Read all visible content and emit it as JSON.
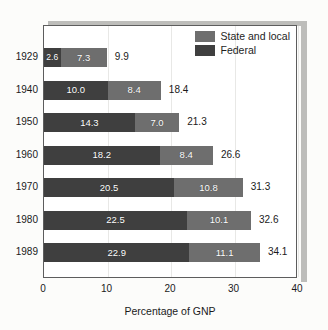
{
  "figure": {
    "background_color": "#fcfcfa",
    "plot_background_color": "#ffffff",
    "frame_color": "#5d5d5d",
    "shadow_color": "#bdbdba",
    "gridline_color": "#e8e8e6"
  },
  "legend": {
    "position": "top-right-inside",
    "entries": [
      {
        "label": "State and local",
        "color": "#6e6e6e",
        "swatch_name": "legend-swatch-state-and-local"
      },
      {
        "label": "Federal",
        "color": "#3f3f3f",
        "swatch_name": "legend-swatch-federal"
      }
    ]
  },
  "axis": {
    "x_title": "Percentage of GNP",
    "x_ticks": [
      "0",
      "10",
      "20",
      "30",
      "40"
    ],
    "x_min": 0,
    "x_max": 40
  },
  "chart_data": {
    "type": "bar",
    "orientation": "horizontal",
    "stacked": true,
    "title": "",
    "subtitle": "",
    "xlabel": "Percentage of GNP",
    "ylabel": "",
    "xlim": [
      0,
      40
    ],
    "xticks": [
      0,
      10,
      20,
      30,
      40
    ],
    "grid": true,
    "legend_position": "top-right",
    "categories": [
      "1929",
      "1940",
      "1950",
      "1960",
      "1970",
      "1980",
      "1989"
    ],
    "series": [
      {
        "name": "Federal",
        "color": "#3f3f3f",
        "values": [
          2.6,
          10.0,
          14.3,
          18.2,
          20.5,
          22.5,
          22.9
        ],
        "labels": [
          "2.6",
          "10.0",
          "14.3",
          "18.2",
          "20.5",
          "22.5",
          "22.9"
        ]
      },
      {
        "name": "State and local",
        "color": "#6e6e6e",
        "values": [
          7.3,
          8.4,
          7.0,
          8.4,
          10.8,
          10.1,
          11.1
        ],
        "labels": [
          "7.3",
          "8.4",
          "7.0",
          "8.4",
          "10.8",
          "10.1",
          "11.1"
        ]
      }
    ],
    "totals": [
      9.9,
      18.4,
      21.3,
      26.6,
      31.3,
      32.6,
      34.1
    ],
    "total_labels": [
      "9.9",
      "18.4",
      "21.3",
      "26.6",
      "31.3",
      "32.6",
      "34.1"
    ]
  }
}
